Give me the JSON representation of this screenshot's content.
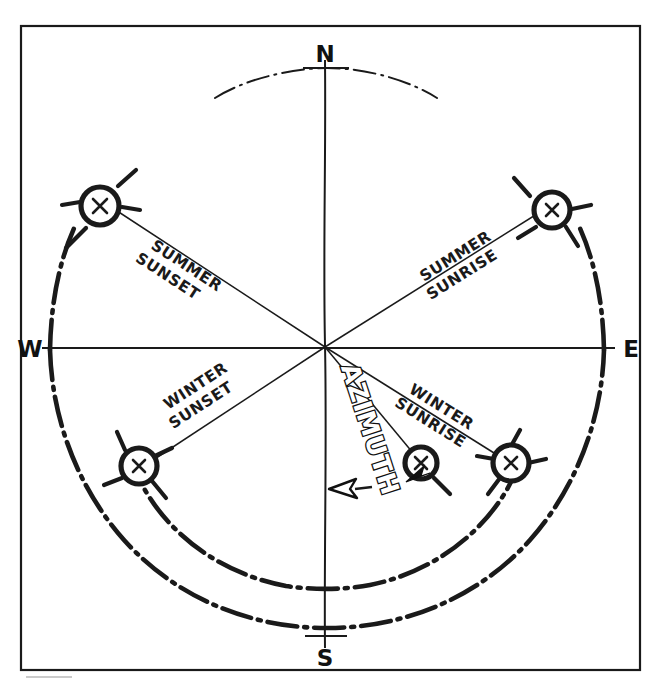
{
  "figure": {
    "kind": "sun-path-azimuth-diagram",
    "ink_color": "#1a1a1a",
    "background_color": "#ffffff"
  },
  "cardinals": {
    "north": "N",
    "east": "E",
    "south": "S",
    "west": "W"
  },
  "labels": {
    "summer_sunset_line1": "SUMMER",
    "summer_sunset_line2": "SUNSET",
    "summer_sunrise_line1": "SUMMER",
    "summer_sunrise_line2": "SUNRISE",
    "winter_sunset_line1": "WINTER",
    "winter_sunset_line2": "SUNSET",
    "winter_sunrise_line1": "WINTER",
    "winter_sunrise_line2": "SUNRISE",
    "azimuth": "AZIMUTH"
  },
  "icons": {
    "sun_summer_sunset": "sun-icon",
    "sun_summer_sunrise": "sun-icon",
    "sun_winter_sunset": "sun-icon",
    "sun_winter_sunrise": "sun-icon",
    "sun_current_position": "sun-icon",
    "azimuth_arrow": "double-arrow-icon"
  }
}
